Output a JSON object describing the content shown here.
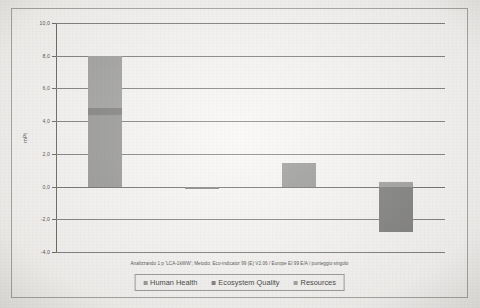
{
  "chart_data": {
    "type": "bar",
    "stacked": true,
    "title": "",
    "subtitle": "Analizzando 1 p 'LCA-1kWW';  Metodo: Eco-indicator 99 (E) V2.06 /  Europe EI 99 E/A / punteggio singolo",
    "xlabel": "",
    "ylabel": "mPt",
    "ylim": [
      -4.0,
      10.0
    ],
    "yticks": [
      10.0,
      8.0,
      6.0,
      4.0,
      2.0,
      0.0,
      -2.0,
      -4.0
    ],
    "ytick_labels": [
      "10,0",
      "8,0",
      "6,0",
      "4,0",
      "2,0",
      "0,0",
      "-2,0",
      "-4,0"
    ],
    "grid": true,
    "legend_position": "bottom",
    "categories": [
      "materials&component",
      "contruction activities",
      "Operation",
      "dismanting"
    ],
    "series": [
      {
        "name": "Human Health",
        "color": "#8a8a88",
        "values": [
          4.4,
          0.0,
          1.45,
          0.0
        ]
      },
      {
        "name": "Ecosystem Quality",
        "color": "#6f6f6d",
        "values": [
          0.4,
          -0.06,
          0.0,
          -2.75
        ]
      },
      {
        "name": "Resources",
        "color": "#949492",
        "values": [
          3.2,
          0.0,
          0.0,
          0.3
        ]
      }
    ],
    "totals": [
      8.0,
      -0.06,
      1.45,
      -2.45
    ],
    "bar_labels_inside": [
      "",
      "",
      "",
      "dismanting"
    ]
  },
  "legend": {
    "entries": [
      {
        "label": "Human Health",
        "color": "#8a8a88"
      },
      {
        "label": "Ecosystem Quality",
        "color": "#6f6f6d"
      },
      {
        "label": "Resources",
        "color": "#949492"
      }
    ]
  },
  "axis": {
    "y_title": "mPt",
    "ticks": [
      {
        "value": 10.0,
        "label": "10,0"
      },
      {
        "value": 8.0,
        "label": "8,0"
      },
      {
        "value": 6.0,
        "label": "6,0"
      },
      {
        "value": 4.0,
        "label": "4,0"
      },
      {
        "value": 2.0,
        "label": "2,0"
      },
      {
        "value": 0.0,
        "label": "0,0"
      },
      {
        "value": -2.0,
        "label": "-2,0"
      },
      {
        "value": -4.0,
        "label": "-4,0"
      }
    ]
  },
  "categories": [
    {
      "label": "materials&component",
      "inside": false
    },
    {
      "label": "contruction activities",
      "inside": false
    },
    {
      "label": "Operation",
      "inside": false
    },
    {
      "label": "dismanting",
      "inside": true
    }
  ],
  "footer": {
    "analysis_note": "Analizzando 1 p 'LCA-1kWW';  Metodo: Eco-indicator 99 (E) V2.06 /  Europe EI 99 E/A / punteggio singolo"
  }
}
